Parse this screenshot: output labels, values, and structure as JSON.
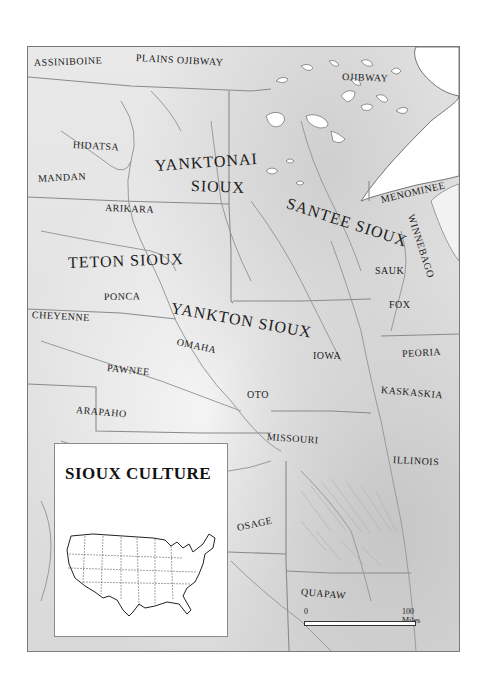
{
  "map": {
    "title": "SIOUX CULTURE",
    "labels": [
      {
        "id": "assiniboine",
        "text": "ASSINIBOINE",
        "x": 33,
        "y": 63,
        "size": "sm",
        "rot": -2
      },
      {
        "id": "plains-ojibway",
        "text": "PLAINS OJIBWAY",
        "x": 135,
        "y": 58,
        "size": "sm",
        "rot": 3
      },
      {
        "id": "ojibway",
        "text": "OJIBWAY",
        "x": 341,
        "y": 77,
        "size": "sm",
        "rot": 2
      },
      {
        "id": "hidatsa",
        "text": "HIDATSA",
        "x": 72,
        "y": 145,
        "size": "sm",
        "rot": 3
      },
      {
        "id": "mandan",
        "text": "MANDAN",
        "x": 37,
        "y": 179,
        "size": "sm",
        "rot": -3
      },
      {
        "id": "yanktonai",
        "text": "YANKTONAI",
        "x": 154,
        "y": 163,
        "size": "lg",
        "rot": -4
      },
      {
        "id": "yanktonai-sioux",
        "text": "SIOUX",
        "x": 190,
        "y": 183,
        "size": "lg",
        "rot": 2
      },
      {
        "id": "santee-sioux",
        "text": "SANTEE SIOUX",
        "x": 286,
        "y": 200,
        "size": "lg",
        "rot": 18
      },
      {
        "id": "menominee",
        "text": "MENOMINEE",
        "x": 380,
        "y": 200,
        "size": "sm",
        "rot": -13
      },
      {
        "id": "winnebago",
        "text": "WINNEBAGO",
        "x": 410,
        "y": 215,
        "size": "sm",
        "rot": 72
      },
      {
        "id": "arikara",
        "text": "ARIKARA",
        "x": 104,
        "y": 208,
        "size": "sm",
        "rot": 2
      },
      {
        "id": "teton-sioux",
        "text": "TETON SIOUX",
        "x": 67,
        "y": 260,
        "size": "lg",
        "rot": -2
      },
      {
        "id": "sauk",
        "text": "SAUK",
        "x": 374,
        "y": 271,
        "size": "sm",
        "rot": 0
      },
      {
        "id": "ponca",
        "text": "PONCA",
        "x": 103,
        "y": 297,
        "size": "sm",
        "rot": -1
      },
      {
        "id": "fox",
        "text": "FOX",
        "x": 388,
        "y": 305,
        "size": "sm",
        "rot": 0
      },
      {
        "id": "yankton-sioux",
        "text": "YANKTON SIOUX",
        "x": 170,
        "y": 305,
        "size": "lg",
        "rot": 10
      },
      {
        "id": "cheyenne",
        "text": "CHEYENNE",
        "x": 31,
        "y": 315,
        "size": "sm",
        "rot": 3
      },
      {
        "id": "omaha",
        "text": "OMAHA",
        "x": 176,
        "y": 342,
        "size": "sm",
        "rot": 12
      },
      {
        "id": "iowa",
        "text": "IOWA",
        "x": 312,
        "y": 356,
        "size": "sm",
        "rot": 0
      },
      {
        "id": "peoria",
        "text": "PEORIA",
        "x": 401,
        "y": 354,
        "size": "sm",
        "rot": -3
      },
      {
        "id": "pawnee",
        "text": "PAWNEE",
        "x": 106,
        "y": 368,
        "size": "sm",
        "rot": 6
      },
      {
        "id": "kaskaskia",
        "text": "KASKASKIA",
        "x": 380,
        "y": 390,
        "size": "sm",
        "rot": 5
      },
      {
        "id": "oto",
        "text": "OTO",
        "x": 246,
        "y": 395,
        "size": "sm",
        "rot": 0
      },
      {
        "id": "arapaho",
        "text": "ARAPAHO",
        "x": 75,
        "y": 410,
        "size": "sm",
        "rot": 5
      },
      {
        "id": "missouri",
        "text": "MISSOURI",
        "x": 266,
        "y": 437,
        "size": "sm",
        "rot": 4
      },
      {
        "id": "illinois",
        "text": "ILLINOIS",
        "x": 392,
        "y": 460,
        "size": "sm",
        "rot": 3
      },
      {
        "id": "osage",
        "text": "OSAGE",
        "x": 236,
        "y": 528,
        "size": "sm",
        "rot": -12
      },
      {
        "id": "quapaw",
        "text": "QUAPAW",
        "x": 300,
        "y": 592,
        "size": "sm",
        "rot": 5
      }
    ],
    "scale": {
      "start": "0",
      "end": "100 Miles"
    }
  }
}
